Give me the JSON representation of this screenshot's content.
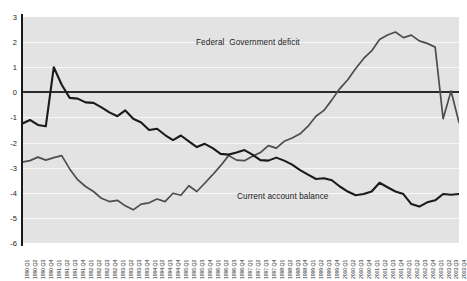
{
  "chart_data": {
    "type": "line",
    "title": "",
    "xlabel": "",
    "ylabel": "",
    "ylim": [
      -6,
      3
    ],
    "ytick_values": [
      3,
      2,
      1,
      0,
      -1,
      -2,
      -3,
      -4,
      -5,
      -6
    ],
    "ytick_labels": [
      "3",
      "2",
      "1",
      "0",
      "-1",
      "-2",
      "-3",
      "-4",
      "-5",
      "-6"
    ],
    "grid": true,
    "zero_line": true,
    "legend_position": "inline-annotation",
    "categories": [
      "1990:Q1",
      "1990:Q2",
      "1990:Q3",
      "1990:Q4",
      "1991:Q1",
      "1991:Q2",
      "1991:Q3",
      "1991:Q4",
      "1992:Q1",
      "1992:Q2",
      "1992:Q3",
      "1992:Q4",
      "1993:Q1",
      "1993:Q2",
      "1993:Q3",
      "1993:Q4",
      "1994:Q1",
      "1994:Q2",
      "1994:Q3",
      "1994:Q4",
      "1995:Q1",
      "1995:Q2",
      "1995:Q3",
      "1995:Q4",
      "1996:Q1",
      "1996:Q2",
      "1996:Q3",
      "1996:Q4",
      "1997:Q1",
      "1997:Q2",
      "1997:Q3",
      "1997:Q4",
      "1998:Q1",
      "1998:Q2",
      "1998:Q3",
      "1998:Q4",
      "1999:Q1",
      "1999:Q2",
      "1999:Q3",
      "1999:Q4",
      "2000:Q1",
      "2000:Q2",
      "2000:Q3",
      "2000:Q4",
      "2001:Q1",
      "2001:Q2",
      "2001:Q3",
      "2001:Q4",
      "2002:Q1",
      "2002:Q2",
      "2002:Q3",
      "2002:Q4",
      "2003:Q1",
      "2003:Q2",
      "2003:Q3",
      "2003:Q4"
    ],
    "series": [
      {
        "name": "Federal  Government deficit",
        "color": "#1a1a1a",
        "annotation_label": "Federal  Government deficit",
        "values": [
          -1.25,
          -1.1,
          -1.3,
          -1.35,
          1.0,
          0.3,
          -0.22,
          -0.25,
          -0.4,
          -0.42,
          -0.6,
          -0.8,
          -0.95,
          -0.72,
          -1.05,
          -1.2,
          -1.5,
          -1.45,
          -1.7,
          -1.9,
          -1.72,
          -1.95,
          -2.18,
          -2.05,
          -2.22,
          -2.45,
          -2.48,
          -2.4,
          -2.3,
          -2.48,
          -2.7,
          -2.72,
          -2.6,
          -2.72,
          -2.88,
          -3.1,
          -3.28,
          -3.45,
          -3.42,
          -3.5,
          -3.75,
          -3.95,
          -4.1,
          -4.05,
          -3.95,
          -3.6,
          -3.78,
          -3.95,
          -4.05,
          -4.45,
          -4.55,
          -4.38,
          -4.3,
          -4.05,
          -4.08,
          -4.05
        ]
      },
      {
        "name": "Current account balance",
        "color": "#4d4d4d",
        "annotation_label": "Current account balance",
        "values": [
          -2.78,
          -2.72,
          -2.58,
          -2.7,
          -2.6,
          -2.52,
          -3.05,
          -3.48,
          -3.75,
          -3.95,
          -4.22,
          -4.35,
          -4.3,
          -4.52,
          -4.68,
          -4.45,
          -4.4,
          -4.25,
          -4.35,
          -4.02,
          -4.1,
          -3.72,
          -3.95,
          -3.62,
          -3.28,
          -2.92,
          -2.52,
          -2.7,
          -2.72,
          -2.55,
          -2.4,
          -2.12,
          -2.22,
          -1.95,
          -1.82,
          -1.65,
          -1.35,
          -0.95,
          -0.72,
          -0.3,
          0.15,
          0.5,
          0.95,
          1.35,
          1.65,
          2.1,
          2.28,
          2.4,
          2.18,
          2.28,
          2.05,
          1.95,
          1.8,
          -1.05,
          0.05,
          -1.2
        ]
      }
    ]
  },
  "annotations": {
    "deficit_label": "Federal  Government deficit",
    "current_label": "Current account balance"
  },
  "colors": {
    "plot_background": "#e3e3e3",
    "gridline": "#f7f7f7",
    "axis": "#1a1a1a",
    "zero_line": "#2b2b2b",
    "series_deficit": "#1a1a1a",
    "series_current": "#4d4d4d",
    "page_background": "#ffffff"
  }
}
